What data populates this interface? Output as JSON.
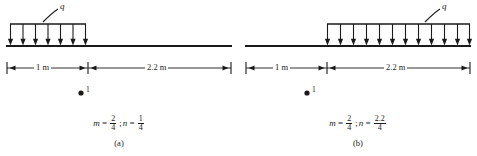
{
  "figure": {
    "type": "engineering-beam-load-diagram",
    "stroke_color": "#1a1a1a",
    "background_color": "#ffffff",
    "panels": [
      {
        "id": "a",
        "caption": "(a)",
        "load_label": "q",
        "load_arrow_count": 7,
        "load_span": "1 m",
        "dimensions": [
          {
            "label": "1 m"
          },
          {
            "label": "2.2 m"
          }
        ],
        "point_label": "1",
        "formula": {
          "m_var": "m",
          "equals": "=",
          "m_num": "2",
          "m_den": "4",
          "separator": ";",
          "n_var": "n",
          "n_num": "1",
          "n_den": "4"
        }
      },
      {
        "id": "b",
        "caption": "(b)",
        "load_label": "q",
        "load_arrow_count": 12,
        "load_span": "2.2 m",
        "dimensions": [
          {
            "label": "1 m"
          },
          {
            "label": "2.2 m"
          }
        ],
        "point_label": "1",
        "formula": {
          "m_var": "m",
          "equals": "=",
          "m_num": "2",
          "m_den": "4",
          "separator": ";",
          "n_var": "n",
          "n_num": "2.2",
          "n_den": "4"
        }
      }
    ]
  }
}
